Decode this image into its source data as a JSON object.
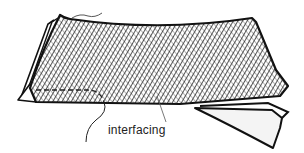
{
  "figure": {
    "labels": {
      "interfacing": "interfacing"
    },
    "colors": {
      "outline": "#111111",
      "hatch": "#333333",
      "background": "#ffffff",
      "underlayer": "#f4f4f4"
    }
  }
}
